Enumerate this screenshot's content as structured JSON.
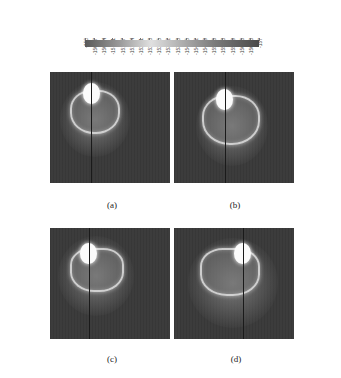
{
  "colorbar": {
    "labels": [
      "-150",
      "-150.37",
      "-150.74",
      "-151.11",
      "-151.47",
      "-151.84",
      "-152.21",
      "-152.58",
      "-152.95",
      "-153.32",
      "-153.68",
      "-154.05",
      "-154.42",
      "-154.79",
      "-155.16",
      "-155.53",
      "-155.89",
      "-156.26",
      "-156.63",
      "-157"
    ],
    "gradient": [
      "#5a5a5a",
      "#9a9a9a",
      "#e0e0e0",
      "#b0b0b0",
      "#7a7a7a",
      "#4a4a4a"
    ]
  },
  "panels": [
    {
      "id": "a",
      "caption": "(a)"
    },
    {
      "id": "b",
      "caption": "(b)"
    },
    {
      "id": "c",
      "caption": "(c)"
    },
    {
      "id": "d",
      "caption": "(d)"
    }
  ]
}
